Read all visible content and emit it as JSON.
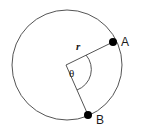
{
  "figure": {
    "kind": "circle-sector-diagram",
    "background_color": "#ffffff",
    "stroke_color": "#555555",
    "point_color": "#000000",
    "label_color": "#1a1a1a",
    "circle": {
      "center_x": 67,
      "center_y": 65,
      "radius": 55,
      "stroke_width": 1
    },
    "points": [
      {
        "id": "A",
        "label": "A",
        "x": 113,
        "y": 42,
        "dot_radius": 4,
        "label_x": 121,
        "label_y": 46
      },
      {
        "id": "B",
        "label": "B",
        "x": 88,
        "y": 115,
        "dot_radius": 4,
        "label_x": 96,
        "label_y": 124
      }
    ],
    "radii": [
      {
        "id": "radius-to-a",
        "from_x": 66,
        "from_y": 65,
        "to_x": 113,
        "to_y": 42
      },
      {
        "id": "radius-to-b",
        "from_x": 66,
        "from_y": 65,
        "to_x": 88,
        "to_y": 115
      }
    ],
    "radius_label": {
      "text": "r",
      "x": 76,
      "y": 50
    },
    "angle_label": {
      "text": "θ",
      "x": 69,
      "y": 77
    },
    "angle_arc": {
      "start_x": 86,
      "start_y": 55,
      "end_x": 77,
      "end_y": 90,
      "arc_radius": 22
    }
  }
}
